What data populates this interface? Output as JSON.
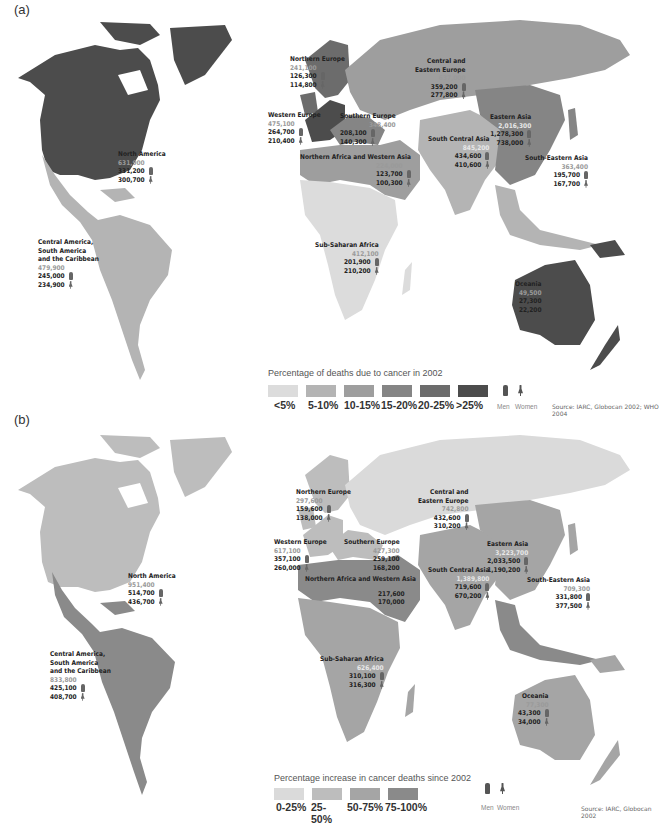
{
  "colors": {
    "a_lt5": "#dcdcdc",
    "a_5_10": "#b4b4b4",
    "a_10_15": "#9e9e9e",
    "a_15_20": "#858585",
    "a_20_25": "#6c6c6c",
    "a_gt25": "#4c4c4c",
    "b_0_25": "#dadada",
    "b_25_50": "#bdbdbd",
    "b_50_75": "#a5a5a5",
    "b_75_100": "#8a8a8a"
  },
  "panel_a": {
    "label": "(a)",
    "legend_title": "Percentage of deaths due to cancer in 2002",
    "legend": [
      "<5%",
      "5-10%",
      "10-15%",
      "15-20%",
      "20-25%",
      ">25%"
    ],
    "men_label": "Men",
    "women_label": "Women",
    "source": "Source: IARC, Globocan 2002; WHO 2004",
    "regions": {
      "north_america": {
        "name": "North America",
        "total": "631,900",
        "men": "331,200",
        "women": "300,700"
      },
      "latin_america": {
        "name1": "Central America,",
        "name2": "South America",
        "name3": "and the Caribbean",
        "total": "479,900",
        "men": "245,000",
        "women": "234,900"
      },
      "northern_europe": {
        "name": "Northern Europe",
        "total": "241,100",
        "men": "126,300",
        "women": "114,800"
      },
      "western_europe": {
        "name": "Western Europe",
        "total": "475,100",
        "men": "264,700",
        "women": "210,400"
      },
      "southern_europe": {
        "name": "Southern Europe",
        "total": "348,400",
        "men": "208,100",
        "women": "140,300"
      },
      "central_eastern_europe": {
        "name1": "Central and",
        "name2": "Eastern Europe",
        "total": "637,000",
        "men": "359,200",
        "women": "277,800"
      },
      "n_africa_w_asia": {
        "name": "Northern Africa and Western Asia",
        "total": "224,000",
        "men": "123,700",
        "women": "100,300"
      },
      "south_central_asia": {
        "name": "South Central Asia",
        "total": "845,200",
        "men": "434,600",
        "women": "410,600"
      },
      "eastern_asia": {
        "name": "Eastern Asia",
        "total": "2,016,300",
        "men": "1,278,300",
        "women": "738,000"
      },
      "south_eastern_asia": {
        "name": "South-Eastern Asia",
        "total": "363,400",
        "men": "195,700",
        "women": "167,700"
      },
      "sub_saharan_africa": {
        "name": "Sub-Saharan Africa",
        "total": "412,100",
        "men": "201,900",
        "women": "210,200"
      },
      "oceania": {
        "name": "Oceania",
        "total": "49,500",
        "men": "27,300",
        "women": "22,200"
      }
    }
  },
  "panel_b": {
    "label": "(b)",
    "legend_title": "Percentage increase in cancer deaths since 2002",
    "legend": [
      "0-25%",
      "25-50%",
      "50-75%",
      "75-100%"
    ],
    "men_label": "Men",
    "women_label": "Women",
    "source": "Source: IARC, Globocan 2002",
    "regions": {
      "north_america": {
        "name": "North America",
        "total": "951,400",
        "men": "514,700",
        "women": "436,700"
      },
      "latin_america": {
        "name1": "Central America,",
        "name2": "South America",
        "name3": "and the Caribbean",
        "total": "833,800",
        "men": "425,100",
        "women": "408,700"
      },
      "northern_europe": {
        "name": "Northern Europe",
        "total": "297,600",
        "men": "159,600",
        "women": "138,000"
      },
      "western_europe": {
        "name": "Western Europe",
        "total": "617,100",
        "men": "357,100",
        "women": "260,000"
      },
      "southern_europe": {
        "name": "Southern Europe",
        "total": "427,300",
        "men": "259,100",
        "women": "168,200"
      },
      "central_eastern_europe": {
        "name1": "Central and",
        "name2": "Eastern Europe",
        "total": "742,800",
        "men": "432,600",
        "women": "310,200"
      },
      "n_africa_w_asia": {
        "name": "Northern Africa and Western Asia",
        "total": "",
        "men": "217,600",
        "women": "170,000"
      },
      "south_central_asia": {
        "name": "South Central Asia",
        "total": "1,389,800",
        "men": "719,600",
        "women": "670,200"
      },
      "eastern_asia": {
        "name": "Eastern Asia",
        "total": "3,223,700",
        "men": "2,033,500",
        "women": "1,190,200"
      },
      "south_eastern_asia": {
        "name": "South-Eastern Asia",
        "total": "709,300",
        "men": "331,800",
        "women": "377,500"
      },
      "sub_saharan_africa": {
        "name": "Sub-Saharan Africa",
        "total": "626,400",
        "men": "310,100",
        "women": "316,300"
      },
      "oceania": {
        "name": "Oceania",
        "total": "77,300",
        "men": "43,300",
        "women": "34,000"
      }
    }
  }
}
